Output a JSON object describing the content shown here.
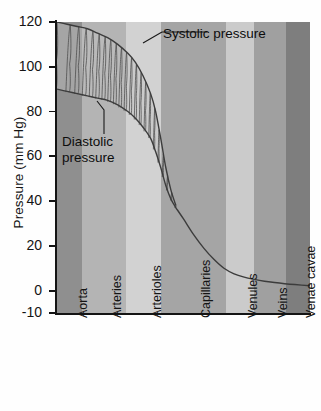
{
  "chart_data": {
    "type": "area",
    "title": "",
    "xlabel": "",
    "ylabel": "Pressure (mm Hg)",
    "ylim": [
      -10,
      120
    ],
    "yticks": [
      120,
      100,
      80,
      60,
      40,
      20,
      0,
      -10
    ],
    "ytick_labels": [
      "120",
      "100",
      "80",
      "60",
      "40",
      "20",
      "0",
      "-10"
    ],
    "grid": false,
    "legend": "none",
    "categories": [
      "Aorta",
      "Arteries",
      "Arterioles",
      "Capillaries",
      "Venules",
      "Veins",
      "Venae cavae"
    ],
    "band_colors": [
      "#8f8f8f",
      "#b4b4b4",
      "#d2d2d2",
      "#a5a5a5",
      "#cbcbcb",
      "#a0a0a0",
      "#7e7e7e"
    ],
    "band_spans": [
      [
        0,
        9.9
      ],
      [
        9.9,
        27.3
      ],
      [
        27.3,
        41.1
      ],
      [
        41.1,
        66.8
      ],
      [
        66.8,
        77.9
      ],
      [
        77.9,
        90.5
      ],
      [
        90.5,
        100
      ]
    ],
    "annotations": [
      {
        "name": "systolic",
        "text": "Systolic pressure"
      },
      {
        "name": "diastolic",
        "text": "Diastolic pressure"
      }
    ],
    "series": [
      {
        "name": "Systolic pressure",
        "x": [
          0,
          4,
          8,
          12,
          16,
          20,
          24,
          28,
          31,
          34,
          37,
          39,
          41,
          43,
          45,
          47
        ],
        "values": [
          120,
          119,
          118,
          117,
          115,
          113,
          110,
          106,
          102,
          96,
          88,
          80,
          68,
          55,
          45,
          38
        ]
      },
      {
        "name": "Diastolic pressure",
        "x": [
          0,
          4,
          8,
          12,
          16,
          20,
          24,
          28,
          31,
          34,
          37,
          39,
          41,
          43,
          45,
          47
        ],
        "values": [
          90,
          89,
          88,
          87,
          86,
          85,
          83,
          80,
          77,
          73,
          68,
          62,
          55,
          47,
          41,
          37
        ]
      },
      {
        "name": "Mean pressure",
        "x": [
          47,
          50,
          54,
          58,
          62,
          66,
          70,
          74,
          78,
          82,
          86,
          90,
          94,
          100
        ],
        "values": [
          37,
          32,
          25,
          19,
          14,
          10,
          7.5,
          6,
          5,
          4.2,
          3.6,
          3.1,
          2.7,
          2.2
        ]
      }
    ],
    "pulse_waves": {
      "count": 22,
      "description": "sawtooth pulse oscillations between systolic and diastolic envelopes"
    }
  }
}
